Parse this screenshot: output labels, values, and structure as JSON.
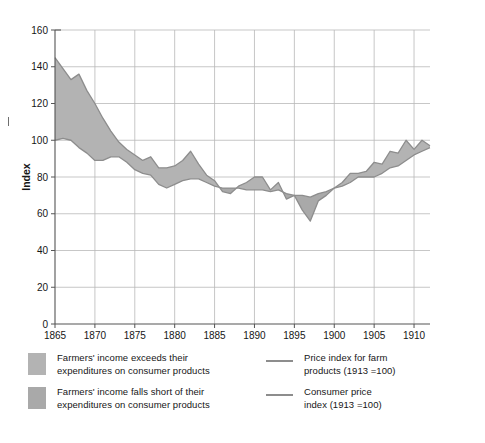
{
  "chart_data": {
    "type": "area",
    "title": "",
    "subtitle": "",
    "xlabel": "",
    "ylabel": "Index",
    "xlim": [
      1865,
      1912
    ],
    "ylim": [
      0,
      160
    ],
    "ytick_step": 20,
    "xtick_step": 5,
    "yticks": [
      "0",
      "20",
      "40",
      "60",
      "80",
      "100",
      "120",
      "140",
      "160"
    ],
    "xticks": [
      "1865",
      "1870",
      "1875",
      "1880",
      "1885",
      "1890",
      "1895",
      "1900",
      "1905",
      "1910"
    ],
    "grid": "horizontal-and-vertical",
    "legend_position": "below",
    "x": [
      1865,
      1866,
      1867,
      1868,
      1869,
      1870,
      1871,
      1872,
      1873,
      1874,
      1875,
      1876,
      1877,
      1878,
      1879,
      1880,
      1881,
      1882,
      1883,
      1884,
      1885,
      1886,
      1887,
      1888,
      1889,
      1890,
      1891,
      1892,
      1893,
      1894,
      1895,
      1896,
      1897,
      1898,
      1899,
      1900,
      1901,
      1902,
      1903,
      1904,
      1905,
      1906,
      1907,
      1908,
      1909,
      1910,
      1911,
      1912
    ],
    "series": [
      {
        "name": "Price index for farm products (1913 =100)",
        "color": "#8d8d8d",
        "values": [
          145,
          139,
          133,
          136,
          127,
          120,
          112,
          105,
          99,
          95,
          92,
          89,
          91,
          85,
          85,
          86,
          89,
          94,
          87,
          81,
          78,
          72,
          71,
          75,
          77,
          80,
          80,
          73,
          77,
          68,
          70,
          62,
          56,
          67,
          70,
          74,
          77,
          82,
          82,
          83,
          88,
          87,
          94,
          93,
          100,
          95,
          100,
          97
        ]
      },
      {
        "name": "Consumer price index (1913 =100)",
        "color": "#8d8d8d",
        "values": [
          100,
          101,
          100,
          96,
          93,
          89,
          89,
          91,
          91,
          88,
          84,
          82,
          81,
          76,
          74,
          76,
          78,
          79,
          79,
          77,
          75,
          74,
          74,
          74,
          73,
          73,
          73,
          72,
          73,
          71,
          70,
          70,
          69,
          71,
          72,
          74,
          75,
          77,
          80,
          80,
          80,
          82,
          85,
          86,
          89,
          92,
          94,
          96
        ]
      }
    ]
  },
  "y_axis": {
    "label": "Index"
  },
  "legend": {
    "left": [
      {
        "swatch_color": "#b3b3b3",
        "label_line1": "Farmers' income exceeds their",
        "label_line2": "expenditures on consumer products"
      },
      {
        "swatch_color": "#a9a9a9",
        "label_line1": "Farmers' income falls short of their",
        "label_line2": "expenditures on consumer products"
      }
    ],
    "right": [
      {
        "line_color": "#8d8d8d",
        "label_line1": "Price index for farm",
        "label_line2": "products (1913 =100)"
      },
      {
        "line_color": "#8d8d8d",
        "label_line1": "Consumer price",
        "label_line2": "index (1913 =100)"
      }
    ]
  },
  "colors": {
    "fill_above": "#b3b3b3",
    "fill_below": "#a9a9a9",
    "line": "#8d8d8d",
    "axis": "#555555",
    "grid": "#b9b9b9",
    "text": "#161616",
    "background": "#ffffff"
  }
}
